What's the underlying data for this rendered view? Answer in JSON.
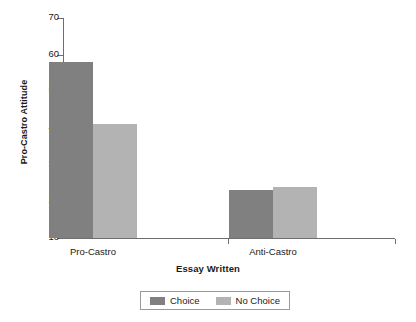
{
  "chart_data": {
    "type": "bar",
    "title": "",
    "xlabel": "Essay Written",
    "ylabel": "Pro-Castro Attitude",
    "categories": [
      "Pro-Castro",
      "Anti-Castro"
    ],
    "series": [
      {
        "name": "Choice",
        "color": "#808080",
        "values": [
          58,
          23
        ]
      },
      {
        "name": "No Choice",
        "color": "#b3b3b3",
        "values": [
          41,
          24
        ]
      }
    ],
    "ylim": [
      10,
      70
    ],
    "yticks": [
      10,
      20,
      30,
      40,
      50,
      60,
      70
    ],
    "ytick_labels": [
      "10",
      "20",
      "30",
      "40",
      "50",
      "60",
      "70"
    ],
    "grid": false,
    "legend_position": "bottom-center"
  }
}
